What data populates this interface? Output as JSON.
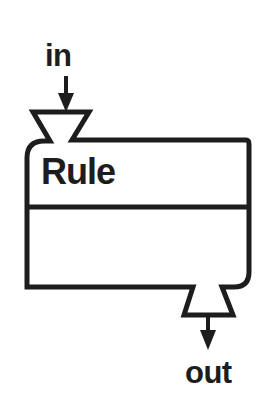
{
  "diagram": {
    "type": "block-diagram",
    "background_color": "#ffffff",
    "stroke_color": "#1d1d1d",
    "block": {
      "label": "Rule",
      "shape": "rounded-rectangle-with-ports",
      "divider": true
    },
    "ports": [
      {
        "name": "input-port",
        "label": "in",
        "position": "top-left",
        "shape": "funnel",
        "arrow_direction": "down-into-block"
      },
      {
        "name": "output-port",
        "label": "out",
        "position": "bottom-right",
        "shape": "inverted-funnel",
        "arrow_direction": "down-out-of-block"
      }
    ],
    "labels": {
      "in": "in",
      "out": "out",
      "rule": "Rule"
    }
  }
}
